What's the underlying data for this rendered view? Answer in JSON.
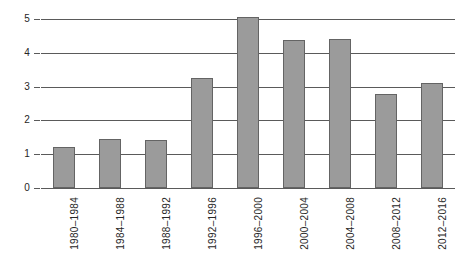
{
  "chart_data": {
    "type": "bar",
    "title": "",
    "subtitle": "",
    "xlabel": "",
    "ylabel": "",
    "categories": [
      "1980–1984",
      "1984–1988",
      "1988–1992",
      "1992–1996",
      "1996–2000",
      "2000–2004",
      "2004–2008",
      "2008–2012",
      "2012–2016"
    ],
    "values": [
      1.22,
      1.44,
      1.42,
      3.25,
      5.05,
      4.38,
      4.4,
      2.77,
      3.1
    ],
    "ylim": [
      0,
      5
    ],
    "yticks": [
      "0",
      "1",
      "2",
      "3",
      "4",
      "5"
    ],
    "ytick_values": [
      0,
      1,
      2,
      3,
      4,
      5
    ],
    "grid": true,
    "grid_axis": "y",
    "legend": false,
    "legend_position": "none",
    "annotations": [],
    "bar_color": "#9b9b9b",
    "bar_border_color": "#646464",
    "gridline_color": "#5a5a5a",
    "axis_text_color": "#262626",
    "background_color": "#ffffff"
  }
}
